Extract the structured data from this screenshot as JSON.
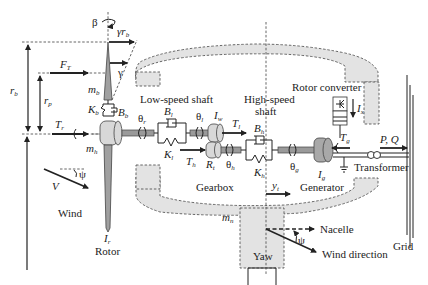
{
  "diagram": {
    "type": "technical-schematic",
    "colors": {
      "housing_fill": "#e3e3e3",
      "shaft_fill": "#9a9a9a",
      "line": "#222222",
      "background": "#ffffff"
    }
  },
  "labels": {
    "low_speed_shaft": "Low-speed shaft",
    "high_speed_shaft_1": "High-speed",
    "high_speed_shaft_2": "shaft",
    "rotor_converter": "Rotor converter",
    "gearbox": "Gearbox",
    "generator": "Generator",
    "transformer": "Transformer",
    "grid": "Grid",
    "wind": "Wind",
    "rotor": "Rotor",
    "yaw": "Yaw",
    "nacelle": "Nacelle",
    "wind_direction": "Wind direction",
    "pq": "P, Q"
  },
  "symbols": {
    "beta": "β",
    "gamma": "γ",
    "gamma_rb_main": "γr",
    "gamma_rb_sub": "b",
    "r_b_main": "r",
    "r_b_sub": "b",
    "r_p_main": "r",
    "r_p_sub": "p",
    "F_T_main": "F",
    "F_T_sub": "T",
    "T_r_main": "T",
    "T_r_sub": "r",
    "m_b_main": "m",
    "m_b_sub": "b",
    "m_h_main": "m",
    "m_h_sub": "h",
    "m_n_main": "m",
    "m_n_sub": "n",
    "K_b_main": "K",
    "K_b_sub": "b",
    "B_b_main": "B",
    "B_b_sub": "b",
    "theta_r_main": "θ",
    "theta_r_sub": "r",
    "B_l_main": "B",
    "B_l_sub": "l",
    "K_l_main": "K",
    "K_l_sub": "l",
    "theta_l_main": "θ",
    "theta_l_sub": "l",
    "I_w_main": "I",
    "I_w_sub": "w",
    "T_l_main": "T",
    "T_l_sub": "l",
    "T_h_main": "T",
    "T_h_sub": "h",
    "R_t_main": "R",
    "R_t_sub": "t",
    "theta_h_main": "θ",
    "theta_h_sub": "h",
    "B_h_main": "B",
    "B_h_sub": "h",
    "K_h_main": "K",
    "K_h_sub": "h",
    "theta_g_main": "θ",
    "theta_g_sub": "g",
    "I_g_main": "I",
    "I_g_sub": "g",
    "T_g_main": "T",
    "T_g_sub": "g",
    "I_x_main": "I",
    "I_x_sub": "x",
    "I_r_main": "I",
    "I_r_sub": "r",
    "y_t_main": "y",
    "y_t_sub": "t",
    "V": "V",
    "psi": "ψ",
    "psi2": "ψ"
  }
}
